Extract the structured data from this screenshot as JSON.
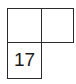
{
  "puzzle": {
    "cells": [
      {
        "row": 0,
        "col": 0,
        "number": "",
        "value": ""
      },
      {
        "row": 0,
        "col": 1,
        "number": "",
        "value": ""
      },
      {
        "row": 1,
        "col": 0,
        "number": "17",
        "value": ""
      }
    ]
  }
}
